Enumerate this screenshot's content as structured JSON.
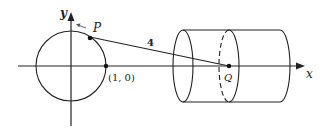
{
  "diagram": {
    "axes": {
      "x_label": "x",
      "y_label": "y"
    },
    "labels": {
      "point_p": "P",
      "point_q": "Q",
      "point_one_zero": "(1, 0)",
      "rod_length": "4"
    },
    "colors": {
      "stroke": "#222222",
      "arrow_p": "#555555",
      "background": "#ffffff"
    }
  }
}
